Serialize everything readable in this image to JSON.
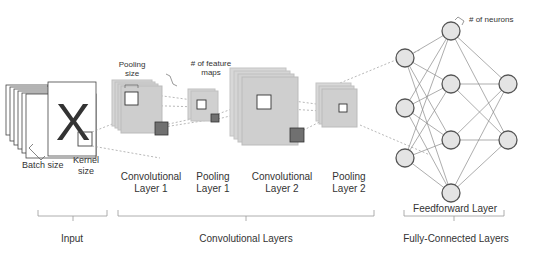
{
  "annotations": {
    "batch_size": "Batch size",
    "kernel_size_1": "Kernel",
    "kernel_size_2": "size",
    "pooling_size_1": "Pooling",
    "pooling_size_2": "size",
    "feature_maps_1": "# of feature",
    "feature_maps_2": "maps",
    "neurons": "# of neurons"
  },
  "layers": [
    {
      "line1": "Convolutional",
      "line2": "Layer 1"
    },
    {
      "line1": "Pooling",
      "line2": "Layer 1"
    },
    {
      "line1": "Convolutional",
      "line2": "Layer 2"
    },
    {
      "line1": "Pooling",
      "line2": "Layer 2"
    }
  ],
  "groups": {
    "input": "Input",
    "conv": "Convolutional Layers",
    "feedforward": "Feedforward Layer",
    "fc": "Fully-Connected Layers"
  },
  "input_glyph": "X",
  "colors": {
    "map_fill": "#d0d0d0",
    "map_stroke": "#bbbbbb",
    "kernel_dark": "#707070",
    "neuron_fill": "#e4e4e4",
    "neuron_stroke": "#555555",
    "line": "#9a9a9a"
  }
}
